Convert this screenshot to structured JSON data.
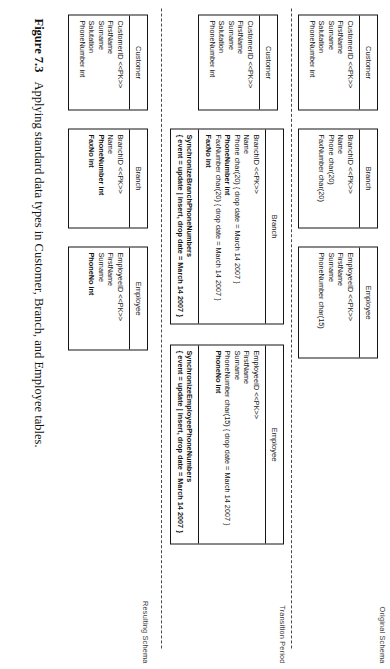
{
  "figure": {
    "caption_number": "Figure 7.3",
    "caption_text": "Applying standard data types in Customer, Branch, and Employee tables."
  },
  "bands": {
    "original": {
      "label": "Original Schema"
    },
    "transition": {
      "label": "Transition Period"
    },
    "resulting": {
      "label": "Resulting Schema"
    }
  },
  "original": {
    "customer": {
      "title": "Customer",
      "attrs": [
        "CustomerID  <<PK>>",
        "FirstName",
        "Surname",
        "Salutation",
        "PhoneNumber int"
      ]
    },
    "branch": {
      "title": "Branch",
      "attrs": [
        "BranchID  <<PK>>",
        "Name",
        "Phone char(20)",
        "FaxNumber char(20)"
      ]
    },
    "employee": {
      "title": "Employee",
      "attrs": [
        "EmployeeID  <<PK>>",
        "FirstName",
        "Surname",
        "PhoneNumber char(15)"
      ]
    }
  },
  "transition": {
    "customer": {
      "title": "Customer",
      "attrs": [
        "CustomerID  <<PK>>",
        "FirstName",
        "Surname",
        "Salutation",
        "PhoneNumber int"
      ]
    },
    "branch": {
      "title": "Branch",
      "attrs": [
        "BranchID  <<PK>>",
        "Name",
        "Phone char(20) { drop date = March 14 2007 }",
        "PhoneNumber int",
        "FaxNumber char(20) { drop date = March 14 2007 }",
        "FaxNo int"
      ],
      "bold_attrs": [
        "PhoneNumber int",
        "FaxNo int"
      ],
      "trigger_name": "SynchronizeBranchPhoneNumbers",
      "trigger_props": "{ event = update | insert, drop date = March 14 2007 }"
    },
    "employee": {
      "title": "Employee",
      "attrs": [
        "EmployeeID  <<PK>>",
        "FirstName",
        "Surname",
        "PhoneNumber char(15) { drop date = March 14 2007 }",
        "PhoneNo int"
      ],
      "bold_attrs": [
        "PhoneNo int"
      ],
      "trigger_name": "SynchronizeEmployeePhoneNumbers",
      "trigger_props": "{ event = update | insert, drop date = March 14 2007 }"
    }
  },
  "resulting": {
    "customer": {
      "title": "Customer",
      "attrs": [
        "CustomerID  <<PK>>",
        "FirstName",
        "Surname",
        "Salutation",
        "PhoneNumber int"
      ]
    },
    "branch": {
      "title": "Branch",
      "attrs": [
        "BranchID  <<PK>>",
        "Name",
        "PhoneNumber int",
        "FaxNo int"
      ],
      "bold_attrs": [
        "PhoneNumber int",
        "FaxNo int"
      ]
    },
    "employee": {
      "title": "Employee",
      "attrs": [
        "EmployeeID  <<PK>>",
        "FirstName",
        "Surname",
        "PhoneNo int"
      ],
      "bold_attrs": [
        "PhoneNo int"
      ]
    }
  }
}
